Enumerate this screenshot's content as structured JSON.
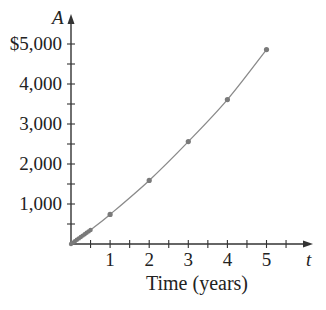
{
  "chart_data": {
    "type": "line",
    "title": "",
    "xlabel": "Time (years)",
    "ylabel": "",
    "x_var": "t",
    "y_var": "A",
    "xlim": [
      0,
      6.2
    ],
    "ylim": [
      0,
      5000
    ],
    "grid": false,
    "legend": null,
    "x_ticks": [
      1,
      2,
      3,
      4,
      5
    ],
    "x_tick_labels": [
      "1",
      "2",
      "3",
      "4",
      "5"
    ],
    "x_minor_step": 0.5,
    "y_ticks": [
      1000,
      2000,
      3000,
      4000,
      5000
    ],
    "y_tick_labels": [
      "1,000",
      "2,000",
      "3,000",
      "4,000",
      "$5,000"
    ],
    "y_minor_step": 500,
    "series": [
      {
        "name": "A(t)",
        "style": "smooth curve with marked points",
        "color": "#8a8a8a",
        "x": [
          0,
          0.05,
          0.1,
          0.15,
          0.2,
          0.25,
          0.3,
          0.35,
          0.4,
          0.45,
          0.5,
          1,
          2,
          3,
          4,
          5
        ],
        "y": [
          0,
          35,
          70,
          105,
          140,
          175,
          210,
          245,
          280,
          315,
          350,
          740,
          1590,
          2560,
          3610,
          4860
        ]
      }
    ]
  },
  "labels": {
    "y_axis_var": "A",
    "x_axis_var": "t",
    "x_axis_title": "Time (years)"
  },
  "colors": {
    "axis": "#333333",
    "curve": "#8a8a8a",
    "points": "#7a7a7a",
    "text": "#222222"
  }
}
